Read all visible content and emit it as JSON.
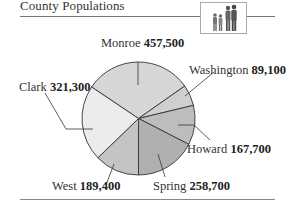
{
  "header": {
    "title": "County Populations",
    "icon": "family-icon"
  },
  "chart_data": {
    "type": "pie",
    "title": "County Populations",
    "categories": [
      "Monroe",
      "Washington",
      "Howard",
      "Spring",
      "West",
      "Clark"
    ],
    "values": [
      457500,
      89100,
      167700,
      258700,
      189400,
      321300
    ],
    "value_labels": [
      "457,500",
      "89,100",
      "167,700",
      "258,700",
      "189,400",
      "321,300"
    ],
    "colors": [
      "#d6d6d6",
      "#cfcfcf",
      "#bdbdbd",
      "#b0b0b0",
      "#c4c4c4",
      "#ececec"
    ],
    "legend": "none",
    "grid": false
  },
  "labels": {
    "monroe": {
      "name": "Monroe",
      "value": "457,500"
    },
    "washington": {
      "name": "Washington",
      "value": "89,100"
    },
    "howard": {
      "name": "Howard",
      "value": "167,700"
    },
    "spring": {
      "name": "Spring",
      "value": "258,700"
    },
    "west": {
      "name": "West",
      "value": "189,400"
    },
    "clark": {
      "name": "Clark",
      "value": "321,300"
    }
  }
}
